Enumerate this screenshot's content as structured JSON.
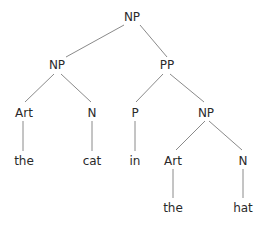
{
  "tree": {
    "nodes": [
      {
        "id": "np-root",
        "label": "NP",
        "x": 132,
        "y": 17
      },
      {
        "id": "np-left",
        "label": "NP",
        "x": 57,
        "y": 65
      },
      {
        "id": "pp",
        "label": "PP",
        "x": 167,
        "y": 65
      },
      {
        "id": "art-1",
        "label": "Art",
        "x": 24,
        "y": 113
      },
      {
        "id": "n-1",
        "label": "N",
        "x": 92,
        "y": 113
      },
      {
        "id": "p",
        "label": "P",
        "x": 135,
        "y": 113
      },
      {
        "id": "np-right",
        "label": "NP",
        "x": 206,
        "y": 113
      },
      {
        "id": "word-the-1",
        "label": "the",
        "x": 24,
        "y": 161
      },
      {
        "id": "word-cat",
        "label": "cat",
        "x": 92,
        "y": 161
      },
      {
        "id": "word-in",
        "label": "in",
        "x": 135,
        "y": 161
      },
      {
        "id": "art-2",
        "label": "Art",
        "x": 173,
        "y": 161
      },
      {
        "id": "n-2",
        "label": "N",
        "x": 243,
        "y": 161
      },
      {
        "id": "word-the-2",
        "label": "the",
        "x": 173,
        "y": 208
      },
      {
        "id": "word-hat",
        "label": "hat",
        "x": 243,
        "y": 208
      }
    ],
    "edges": [
      {
        "from": "np-root",
        "to": "np-left",
        "x1": 124,
        "y1": 25,
        "x2": 66,
        "y2": 57
      },
      {
        "from": "np-root",
        "to": "pp",
        "x1": 140,
        "y1": 25,
        "x2": 167,
        "y2": 57
      },
      {
        "from": "np-left",
        "to": "art-1",
        "x1": 54,
        "y1": 74,
        "x2": 25,
        "y2": 102
      },
      {
        "from": "np-left",
        "to": "n-1",
        "x1": 61,
        "y1": 74,
        "x2": 91,
        "y2": 102
      },
      {
        "from": "pp",
        "to": "p",
        "x1": 163,
        "y1": 74,
        "x2": 136,
        "y2": 102
      },
      {
        "from": "pp",
        "to": "np-right",
        "x1": 170,
        "y1": 74,
        "x2": 204,
        "y2": 102
      },
      {
        "from": "art-1",
        "to": "word-the-1",
        "x1": 23,
        "y1": 121,
        "x2": 23,
        "y2": 151
      },
      {
        "from": "n-1",
        "to": "word-cat",
        "x1": 92,
        "y1": 121,
        "x2": 92,
        "y2": 151
      },
      {
        "from": "p",
        "to": "word-in",
        "x1": 135,
        "y1": 121,
        "x2": 135,
        "y2": 151
      },
      {
        "from": "np-right",
        "to": "art-2",
        "x1": 205,
        "y1": 121,
        "x2": 176,
        "y2": 150
      },
      {
        "from": "np-right",
        "to": "n-2",
        "x1": 209,
        "y1": 121,
        "x2": 242,
        "y2": 150
      },
      {
        "from": "art-2",
        "to": "word-the-2",
        "x1": 173,
        "y1": 169,
        "x2": 173,
        "y2": 198
      },
      {
        "from": "n-2",
        "to": "word-hat",
        "x1": 243,
        "y1": 169,
        "x2": 243,
        "y2": 198
      }
    ]
  },
  "colors": {
    "edge": "#8a8a8a",
    "text": "#2a2a2a",
    "background": "#ffffff"
  }
}
